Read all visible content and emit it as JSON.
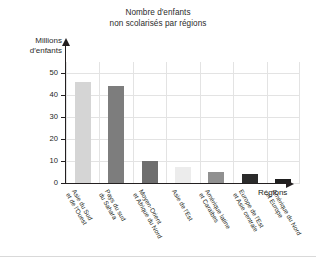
{
  "chart_data": {
    "type": "bar",
    "title_lines": [
      "Nombre d′enfants",
      "non scolarisés par régions"
    ],
    "xlabel": "Régions",
    "ylabel": "Millions d'enfants",
    "ylabel_lines": [
      "Millions",
      "d′enfants"
    ],
    "ylim": [
      0,
      55
    ],
    "yticks": [
      0,
      10,
      20,
      30,
      40,
      50
    ],
    "ytick_labels": [
      "0",
      "10",
      "20",
      "30",
      "40",
      "50"
    ],
    "grid": true,
    "legend": "none",
    "categories": [
      "Asie du Sud et de l'Ouest",
      "Pays du sud du Sahara",
      "Moyen-Orient et Afrique du Nord",
      "Asie de l'Est",
      "Amérique latine et Caraïbes",
      "Europe de l'Est et Asie centrale",
      "Amérique du Nord et Europe"
    ],
    "category_lines": [
      [
        "Asie du Sud",
        "et de l′Ouest"
      ],
      [
        "Pays du sud",
        "du Sahara"
      ],
      [
        "Moyen-Orient",
        "et Afrique du Nord"
      ],
      [
        "Asie de l′Est"
      ],
      [
        "Amérique latine",
        "et Caraïbes"
      ],
      [
        "Europe de l′Est",
        "et Asie centrale"
      ],
      [
        "Amérique du Nord",
        "et Europe"
      ]
    ],
    "values": [
      46,
      44,
      10,
      7.5,
      5,
      4,
      2
    ],
    "bar_colors": [
      "#d5d5d5",
      "#7d7d7d",
      "#6e6e6e",
      "#ececec",
      "#909090",
      "#2b2b2b",
      "#1f1f1f"
    ]
  }
}
